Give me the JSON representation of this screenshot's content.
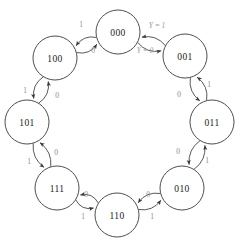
{
  "diagram": {
    "type": "state-transition-diagram",
    "background_color": "#ffffff",
    "node_stroke_color": "#3a3a3a",
    "node_fill_color": "#ffffff",
    "edge_color": "#3a3a3a",
    "edge_label_color": "#8a8a8a",
    "output_label_color": "#9a9a9a",
    "node_radius": 22,
    "states": [
      {
        "id": "s000",
        "label": "000",
        "cx": 118,
        "cy": 32
      },
      {
        "id": "s001",
        "label": "001",
        "cx": 185,
        "cy": 56
      },
      {
        "id": "s011",
        "label": "011",
        "cx": 212,
        "cy": 122
      },
      {
        "id": "s010",
        "label": "010",
        "cx": 182,
        "cy": 188
      },
      {
        "id": "s110",
        "label": "110",
        "cx": 117,
        "cy": 215
      },
      {
        "id": "s111",
        "label": "111",
        "cx": 57,
        "cy": 188
      },
      {
        "id": "s101",
        "label": "101",
        "cx": 27,
        "cy": 122
      },
      {
        "id": "s100",
        "label": "100",
        "cx": 55,
        "cy": 58
      }
    ],
    "transitions": [
      {
        "id": "t-000-001",
        "from": "s000",
        "to": "s001",
        "label": "Y = 1",
        "label_x": 157,
        "label_y": 25,
        "style": "output"
      },
      {
        "id": "t-001-000",
        "from": "s001",
        "to": "s000",
        "label": "Y = 0",
        "label_x": 145,
        "label_y": 50,
        "style": "output"
      },
      {
        "id": "t-001-011",
        "from": "s001",
        "to": "s011",
        "label": "1",
        "label_x": 209,
        "label_y": 84,
        "style": "input"
      },
      {
        "id": "t-011-001",
        "from": "s011",
        "to": "s001",
        "label": "0",
        "label_x": 179,
        "label_y": 94,
        "style": "input"
      },
      {
        "id": "t-011-010",
        "from": "s011",
        "to": "s010",
        "label": "1",
        "label_x": 207,
        "label_y": 160,
        "style": "input"
      },
      {
        "id": "t-010-011",
        "from": "s010",
        "to": "s011",
        "label": "0",
        "label_x": 178,
        "label_y": 151,
        "style": "input"
      },
      {
        "id": "t-010-110",
        "from": "s010",
        "to": "s110",
        "label": "1",
        "label_x": 152,
        "label_y": 216,
        "style": "input"
      },
      {
        "id": "t-110-010",
        "from": "s110",
        "to": "s010",
        "label": "0",
        "label_x": 148,
        "label_y": 194,
        "style": "input"
      },
      {
        "id": "t-110-111",
        "from": "s110",
        "to": "s111",
        "label": "1",
        "label_x": 83,
        "label_y": 216,
        "style": "input"
      },
      {
        "id": "t-111-110",
        "from": "s111",
        "to": "s110",
        "label": "0",
        "label_x": 86,
        "label_y": 194,
        "style": "input"
      },
      {
        "id": "t-111-101",
        "from": "s111",
        "to": "s101",
        "label": "1",
        "label_x": 29,
        "label_y": 161,
        "style": "input"
      },
      {
        "id": "t-101-111",
        "from": "s101",
        "to": "s111",
        "label": "0",
        "label_x": 56,
        "label_y": 152,
        "style": "input"
      },
      {
        "id": "t-101-100",
        "from": "s101",
        "to": "s100",
        "label": "1",
        "label_x": 25,
        "label_y": 90,
        "style": "input"
      },
      {
        "id": "t-100-101",
        "from": "s100",
        "to": "s101",
        "label": "0",
        "label_x": 57,
        "label_y": 95,
        "style": "input"
      },
      {
        "id": "t-100-000",
        "from": "s100",
        "to": "s000",
        "label": "1",
        "label_x": 81,
        "label_y": 24,
        "style": "input"
      },
      {
        "id": "t-000-100",
        "from": "s000",
        "to": "s100",
        "label": "0",
        "label_x": 93,
        "label_y": 50,
        "style": "input"
      }
    ]
  }
}
